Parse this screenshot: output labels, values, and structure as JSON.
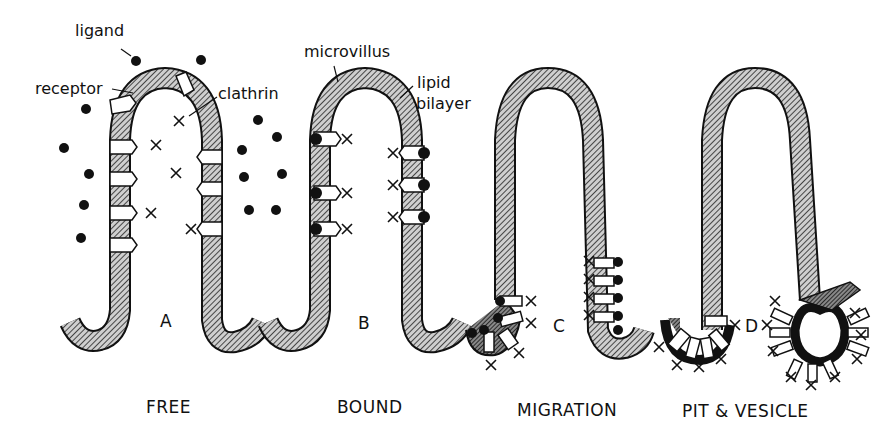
{
  "diagram": {
    "labels": {
      "ligand": "ligand",
      "receptor": "receptor",
      "clathrin": "clathrin",
      "microvillus": "microvillus",
      "lipid_bilayer_line1": "lipid",
      "lipid_bilayer_line2": "bilayer"
    },
    "panels": [
      {
        "letter": "A",
        "caption": "FREE"
      },
      {
        "letter": "B",
        "caption": "BOUND"
      },
      {
        "letter": "C",
        "caption": "MIGRATION"
      },
      {
        "letter": "D",
        "caption": "PIT & VESICLE"
      }
    ],
    "colors": {
      "ink": "#111111",
      "background": "#ffffff"
    }
  }
}
